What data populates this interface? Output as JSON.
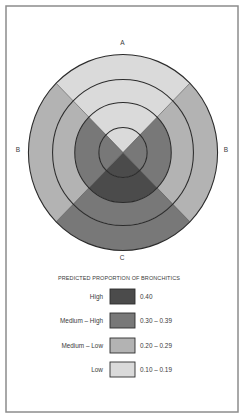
{
  "colors": {
    "page_bg": "#ffffff",
    "frame_border": "#8c8c8c",
    "ring_stroke": "#2b2b2b",
    "text": "#3a3a3a"
  },
  "chart_data": {
    "type": "heatmap",
    "layout": "concentric rings divided into 4 quadrants",
    "title": "PREDICTED PROPORTION OF BRONCHITICS",
    "quadrant_labels": {
      "top": "A",
      "left": "B",
      "right": "B",
      "bottom": "C"
    },
    "ring_order": "outer to inner",
    "cells": {
      "top": [
        "Low",
        "Low",
        "Low",
        "Low"
      ],
      "right": [
        "Medium – Low",
        "Medium – Low",
        "Medium – High",
        "Medium – High"
      ],
      "bottom": [
        "Medium – High",
        "Medium – High",
        "High",
        "High"
      ],
      "left": [
        "Medium – Low",
        "Medium – Low",
        "Medium – High",
        "Medium – High"
      ]
    },
    "legend": {
      "position": "below",
      "items": [
        {
          "label": "High",
          "range": "0.40",
          "color": "#4b4b4b"
        },
        {
          "label": "Medium – High",
          "range": "0.30 – 0.39",
          "color": "#787878"
        },
        {
          "label": "Medium – Low",
          "range": "0.20 – 0.29",
          "color": "#b3b3b3"
        },
        {
          "label": "Low",
          "range": "0.10 – 0.19",
          "color": "#dadada"
        }
      ]
    }
  }
}
